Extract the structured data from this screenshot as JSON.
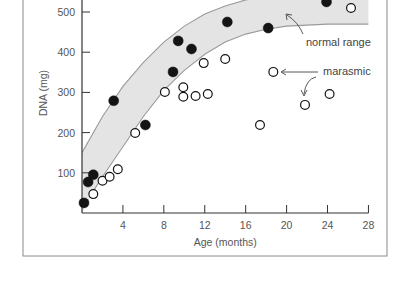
{
  "chart_data": {
    "type": "scatter",
    "title": "",
    "xlabel": "Age (months)",
    "ylabel": "DNA (mg)",
    "xlim": [
      0,
      28
    ],
    "ylim": [
      0,
      530
    ],
    "x_ticks": [
      4,
      8,
      12,
      16,
      20,
      24,
      28
    ],
    "y_ticks": [
      100,
      200,
      300,
      400,
      500
    ],
    "grid": false,
    "band": {
      "name": "normal range",
      "upper": [
        [
          0,
          150
        ],
        [
          2,
          240
        ],
        [
          4,
          315
        ],
        [
          6,
          375
        ],
        [
          8,
          425
        ],
        [
          10,
          465
        ],
        [
          12,
          495
        ],
        [
          14,
          515
        ],
        [
          16,
          530
        ],
        [
          20,
          545
        ],
        [
          24,
          550
        ],
        [
          28,
          552
        ]
      ],
      "lower": [
        [
          1,
          50
        ],
        [
          2,
          90
        ],
        [
          4,
          165
        ],
        [
          6,
          240
        ],
        [
          8,
          305
        ],
        [
          10,
          355
        ],
        [
          12,
          395
        ],
        [
          14,
          425
        ],
        [
          16,
          445
        ],
        [
          18,
          457
        ],
        [
          20,
          465
        ],
        [
          24,
          470
        ],
        [
          28,
          470
        ]
      ]
    },
    "series": [
      {
        "name": "normal",
        "marker": "filled-circle",
        "points": [
          [
            0.2,
            25
          ],
          [
            0.6,
            77
          ],
          [
            1.1,
            95
          ],
          [
            3.1,
            279
          ],
          [
            6.2,
            219
          ],
          [
            8.9,
            351
          ],
          [
            9.4,
            428
          ],
          [
            10.7,
            408
          ],
          [
            14.2,
            475
          ],
          [
            18.2,
            460
          ],
          [
            23.9,
            525
          ]
        ]
      },
      {
        "name": "marasmic",
        "marker": "open-circle",
        "points": [
          [
            1.1,
            47
          ],
          [
            2.0,
            80
          ],
          [
            2.7,
            90
          ],
          [
            3.5,
            109
          ],
          [
            5.2,
            199
          ],
          [
            8.1,
            301
          ],
          [
            9.9,
            313
          ],
          [
            9.9,
            289
          ],
          [
            11.1,
            291
          ],
          [
            12.3,
            296
          ],
          [
            11.9,
            373
          ],
          [
            14.0,
            383
          ],
          [
            17.4,
            219
          ],
          [
            18.7,
            351
          ],
          [
            21.8,
            269
          ],
          [
            24.2,
            296
          ],
          [
            26.3,
            510
          ]
        ]
      }
    ],
    "annotations": [
      {
        "text": "normal range",
        "points_to": "band"
      },
      {
        "text": "marasmic",
        "points_to": "open circles"
      }
    ]
  }
}
